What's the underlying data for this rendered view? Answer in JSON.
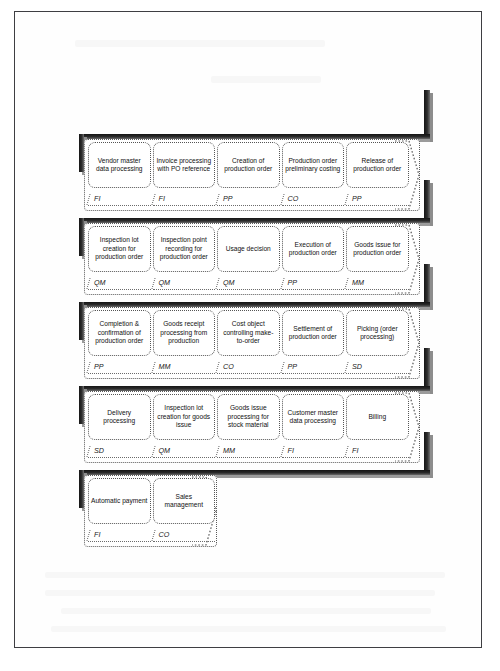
{
  "diagram": {
    "module_codes": [
      "FI",
      "PP",
      "CO",
      "MM",
      "QM",
      "SD"
    ],
    "colors": {
      "ribbon": "#1b1b1b",
      "ribbon_highlight": "#9b9b9b",
      "outline": "#5a5a5a",
      "frame": "#3e3e42",
      "text": "#111111"
    },
    "rows": [
      {
        "index": 1,
        "steps": [
          {
            "label": "Vendor master data processing",
            "module": "FI"
          },
          {
            "label": "Invoice processing with PO reference",
            "module": "FI"
          },
          {
            "label": "Creation of production order",
            "module": "PP"
          },
          {
            "label": "Production order preliminary costing",
            "module": "CO"
          },
          {
            "label": "Release of production order",
            "module": "PP"
          }
        ]
      },
      {
        "index": 2,
        "steps": [
          {
            "label": "Inspection lot creation for production order",
            "module": "QM"
          },
          {
            "label": "Inspection point recording for production order",
            "module": "QM"
          },
          {
            "label": "Usage decision",
            "module": "QM"
          },
          {
            "label": "Execution of production order",
            "module": "PP"
          },
          {
            "label": "Goods issue for production order",
            "module": "MM"
          }
        ]
      },
      {
        "index": 3,
        "steps": [
          {
            "label": "Completion & confirmation of production order",
            "module": "PP"
          },
          {
            "label": "Goods receipt processing from production",
            "module": "MM"
          },
          {
            "label": "Cost object controlling make-to-order",
            "module": "CO"
          },
          {
            "label": "Settlement of production order",
            "module": "PP"
          },
          {
            "label": "Picking (order processing)",
            "module": "SD"
          }
        ]
      },
      {
        "index": 4,
        "steps": [
          {
            "label": "Delivery processing",
            "module": "SD"
          },
          {
            "label": "Inspection lot creation for goods issue",
            "module": "QM"
          },
          {
            "label": "Goods issue processing for stock material",
            "module": "MM"
          },
          {
            "label": "Customer master data processing",
            "module": "FI"
          },
          {
            "label": "Billing",
            "module": "FI"
          }
        ]
      },
      {
        "index": 5,
        "steps": [
          {
            "label": "Automatic payment",
            "module": "FI"
          },
          {
            "label": "Sales management",
            "module": "CO"
          }
        ]
      }
    ]
  }
}
